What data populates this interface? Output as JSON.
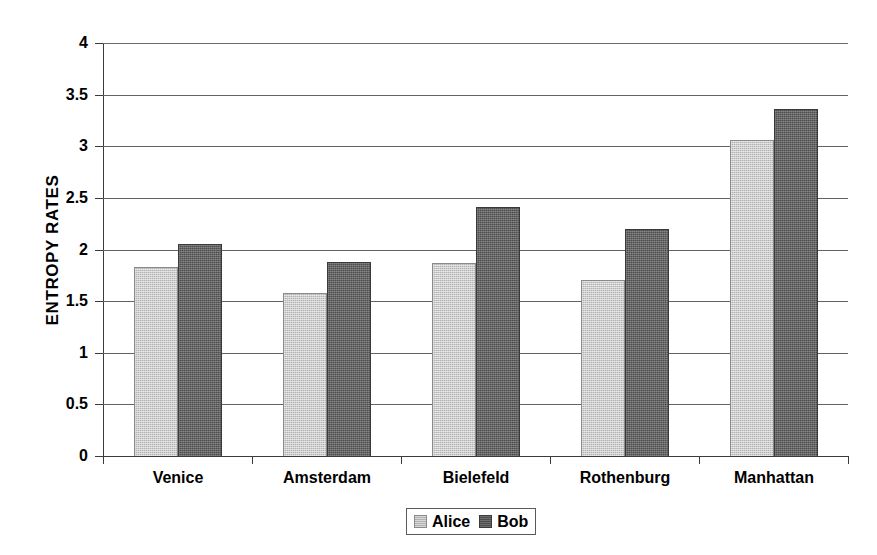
{
  "chart_data": {
    "type": "bar",
    "title": "",
    "xlabel": "",
    "ylabel": "ENTROPY RATES",
    "categories": [
      "Venice",
      "Amsterdam",
      "Bielefeld",
      "Rothenburg",
      "Manhattan"
    ],
    "series": [
      {
        "name": "Alice",
        "color": "#b2b2b2",
        "values": [
          1.83,
          1.58,
          1.87,
          1.7,
          3.06
        ]
      },
      {
        "name": "Bob",
        "color": "#4d4d4d",
        "values": [
          2.05,
          1.88,
          2.41,
          2.2,
          3.36
        ]
      }
    ],
    "ylim": [
      0,
      4
    ],
    "yticks": [
      "4",
      "3.5",
      "3",
      "2.5",
      "2",
      "1.5",
      "1",
      "0.5",
      "0"
    ],
    "ytick_values": [
      4,
      3.5,
      3,
      2.5,
      2,
      1.5,
      1,
      0.5,
      0
    ],
    "grid": true,
    "grid_axis": "y",
    "legend_position": "bottom-center",
    "legend_entries": [
      "Alice",
      "Bob"
    ]
  }
}
